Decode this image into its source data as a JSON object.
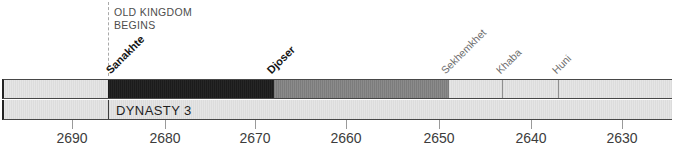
{
  "timeline": {
    "era_marker": {
      "line1": "OLD KINGDOM",
      "line2": "BEGINS",
      "year": 2686
    },
    "dynasty_label": "DYNASTY 3",
    "reigns": [
      {
        "name": "Sanakhte",
        "start_year_bc": 2686,
        "end_year_bc": 2668,
        "emphasis": "bold",
        "bar_color": "#1d1d1d"
      },
      {
        "name": "Djoser",
        "start_year_bc": 2668,
        "end_year_bc": 2649,
        "emphasis": "bold",
        "bar_color": "#828282"
      },
      {
        "name": "Sekhemkhet",
        "start_year_bc": 2649,
        "end_year_bc": 2643,
        "emphasis": "normal",
        "bar_color": "#e1e1e1"
      },
      {
        "name": "Khaba",
        "start_year_bc": 2643,
        "end_year_bc": 2637,
        "emphasis": "normal",
        "bar_color": "#e1e1e1"
      },
      {
        "name": "Huni",
        "start_year_bc": 2637,
        "end_year_bc": null,
        "emphasis": "normal",
        "bar_color": "#e1e1e1"
      }
    ],
    "axis": {
      "unit": "years BC",
      "direction": "descending",
      "ticks": [
        "2690",
        "2680",
        "2670",
        "2660",
        "2650",
        "2640",
        "2630"
      ]
    },
    "colors": {
      "background": "#ffffff",
      "bar_light": "#e1e1e1",
      "bar_dark": "#1d1d1d",
      "bar_mid_gray": "#828282",
      "bar_border": "#474747",
      "dashed_line": "#a9a9a9",
      "era_text": "#4d4d4d",
      "gray_label_text": "#6e6e6e",
      "bold_label_text": "#141414",
      "tick_text": "#3c3c3c"
    }
  }
}
